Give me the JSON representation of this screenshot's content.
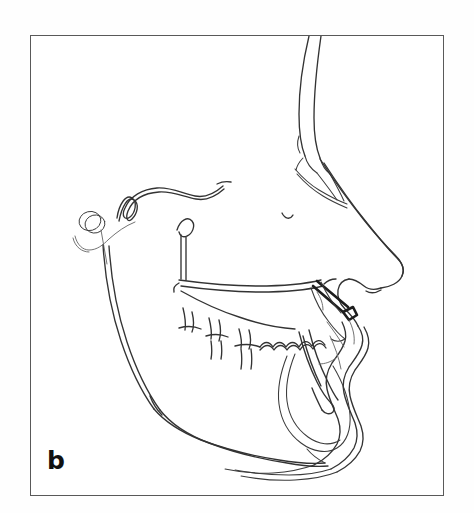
{
  "figure": {
    "panel_label": "b",
    "caption_text": "",
    "background_color": "#ffffff",
    "frame_color": "#595959",
    "ink_color": "#3b3b3b",
    "bold_ink_color": "#1d1d1d",
    "faint_ink_color": "#6a6a6a"
  },
  "tracing": {
    "title": "Lateral cephalometric tracing",
    "orientation": "profile facing right",
    "structures": [
      {
        "name": "soft-tissue-forehead-profile",
        "label": "Soft tissue forehead"
      },
      {
        "name": "frontal-bone-outline",
        "label": "Frontal bone"
      },
      {
        "name": "nasal-bone-and-nasion",
        "label": "Nasal bone / nasion"
      },
      {
        "name": "soft-tissue-nose-profile",
        "label": "Soft tissue nose"
      },
      {
        "name": "subnasale-and-upper-lip",
        "label": "Subnasale / upper lip"
      },
      {
        "name": "lower-lip-and-soft-tissue-chin",
        "label": "Lower lip / soft tissue chin"
      },
      {
        "name": "submental-neck-contour",
        "label": "Submental neck contour"
      },
      {
        "name": "sella-turcica-cranial-base-outline",
        "label": "Sella turcica / cranial base"
      },
      {
        "name": "porion-condyle-marker-circle",
        "label": "Porion marker"
      },
      {
        "name": "posterior-ramus-border",
        "label": "Posterior ramus border"
      },
      {
        "name": "frankfort-horizontal-reference-line",
        "label": "Frankfort horizontal reference"
      },
      {
        "name": "pterygomaxillary-fissure",
        "label": "Pterygomaxillary fissure"
      },
      {
        "name": "palatal-plane-maxilla",
        "label": "Palatal plane / maxilla"
      },
      {
        "name": "orbital-floor-marker",
        "label": "Orbital floor marker"
      },
      {
        "name": "maxillary-posterior-teeth",
        "label": "Maxillary posterior teeth"
      },
      {
        "name": "mandibular-posterior-teeth",
        "label": "Mandibular posterior teeth"
      },
      {
        "name": "maxillary-central-incisor",
        "label": "Maxillary central incisor"
      },
      {
        "name": "mandibular-central-incisor",
        "label": "Mandibular central incisor"
      },
      {
        "name": "mandibular-body-and-gonial-angle",
        "label": "Mandibular body / gonial angle"
      },
      {
        "name": "mandibular-symphysis",
        "label": "Mandibular symphysis"
      }
    ]
  }
}
